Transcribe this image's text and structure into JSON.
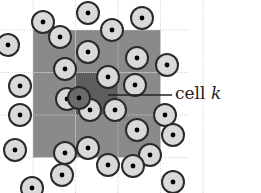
{
  "figure": {
    "type": "cell-list neighbor search diagram",
    "label_text": "cell",
    "label_var": "k",
    "colors": {
      "neighbor_cells": "#8a8a8a",
      "center_cell": "#5e5e5e",
      "grid_lines": "#cfcfcf",
      "particle_fill": "#d9d9d9",
      "particle_ring": "#2a2a2a",
      "particle_dot": "#000000",
      "highlight_particle": "#6a6a6a",
      "leader_line": "#222222"
    },
    "grid": {
      "x0": 33,
      "y0": 30,
      "cell": 42.5,
      "cols": 3,
      "rows": 3,
      "center_col": 1,
      "center_row": 1
    },
    "particles": [
      [
        43,
        22
      ],
      [
        88,
        13
      ],
      [
        142,
        18
      ],
      [
        112,
        30
      ],
      [
        60,
        37
      ],
      [
        88,
        52
      ],
      [
        137,
        58
      ],
      [
        167,
        65
      ],
      [
        65,
        69
      ],
      [
        108,
        77
      ],
      [
        135,
        85
      ],
      [
        20,
        86
      ],
      [
        67,
        99
      ],
      [
        90,
        110
      ],
      [
        115,
        110
      ],
      [
        165,
        115
      ],
      [
        20,
        115
      ],
      [
        137,
        130
      ],
      [
        173,
        135
      ],
      [
        15,
        150
      ],
      [
        88,
        148
      ],
      [
        65,
        153
      ],
      [
        150,
        155
      ],
      [
        108,
        165
      ],
      [
        133,
        166
      ],
      [
        62,
        175
      ],
      [
        32,
        188
      ],
      [
        173,
        182
      ],
      [
        8,
        45
      ]
    ],
    "highlight_particle": [
      79,
      98
    ],
    "particle_radius": 11
  }
}
